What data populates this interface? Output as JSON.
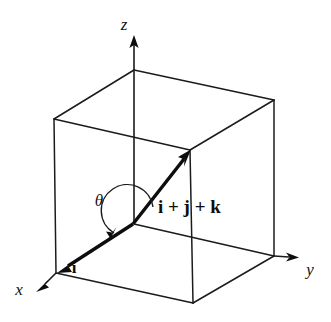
{
  "figure": {
    "type": "diagram",
    "background_color": "#ffffff",
    "line_color": "#1b1b1b",
    "vector_color": "#0d0d0d",
    "width": 331,
    "height": 322
  },
  "axes": {
    "x": {
      "label": "x",
      "label_x": 18,
      "label_y": 294,
      "origin": [
        56,
        273
      ],
      "tip": [
        38,
        290
      ]
    },
    "y": {
      "label": "y",
      "label_x": 308,
      "label_y": 274,
      "origin": [
        274,
        256
      ],
      "tip": [
        298,
        257
      ]
    },
    "z": {
      "label": "z",
      "label_x": 124,
      "label_y": 30,
      "origin": [
        134,
        224
      ],
      "tip": [
        134,
        36
      ]
    }
  },
  "cube": {
    "vertices": {
      "bottom_front_left": [
        56,
        273
      ],
      "bottom_front": [
        193,
        303
      ],
      "bottom_right": [
        274,
        256
      ],
      "bottom_back": [
        134,
        224
      ],
      "top_front_left": [
        54,
        119
      ],
      "top_front": [
        190,
        150
      ],
      "top_right": [
        274,
        100
      ],
      "top_back": [
        134,
        70
      ]
    }
  },
  "vectors": [
    {
      "name": "i-vector",
      "label": "i",
      "label_x": 74,
      "label_y": 272,
      "from": [
        133,
        224
      ],
      "to": [
        60,
        272
      ],
      "arrowhead": "at-origin"
    },
    {
      "name": "diagonal-vector",
      "label": "i + j + k",
      "label_x": 158,
      "label_y": 213,
      "from": [
        133,
        224
      ],
      "to": [
        190,
        151
      ],
      "arrowhead": "at-tip"
    }
  ],
  "angle": {
    "symbol": "θ",
    "label_x": 98,
    "label_y": 205,
    "center": [
      133,
      224
    ],
    "radius": 26,
    "description": "angle between i and i+j+k"
  }
}
